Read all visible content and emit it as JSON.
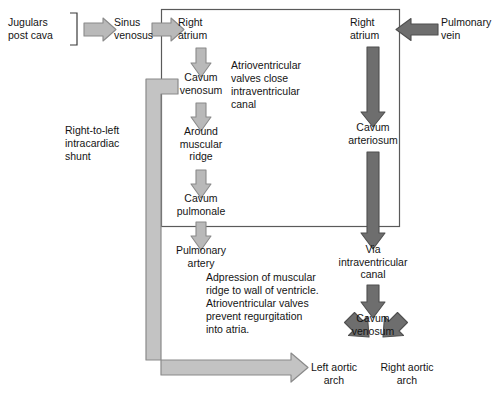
{
  "diagram": {
    "colors": {
      "light_arrow_fill": "#b9b9b9",
      "light_arrow_stroke": "#8a8a8a",
      "dark_arrow_fill": "#6e6e6e",
      "dark_arrow_stroke": "#4f4f4f",
      "shunt_fill": "#c3c3c3",
      "shunt_stroke": "#8a8a8a",
      "box_stroke": "#5a5a5a",
      "text": "#141414",
      "background": "#ffffff"
    },
    "nodes": {
      "jugulars": "Jugulars\npost cava",
      "sinus_venosus": "Sinus\nvenosus",
      "right_atrium_left": "Right\natrium",
      "cavum_venosum_left": "Cavum\nvenosum",
      "around_muscular_ridge": "Around\nmuscular\nridge",
      "cavum_pulmonale": "Cavum\npulmonale",
      "pulmonary_artery": "Pulmonary\nartery",
      "right_atrium_right": "Right\natrium",
      "pulmonary_vein": "Pulmonary\nvein",
      "cavum_arteriosum": "Cavum\narteriosum",
      "via_intraventricular_canal": "Via\nintraventricular\ncanal",
      "cavum_venosum_right": "Cavum\nvenosum",
      "left_aortic_arch": "Left aortic\narch",
      "right_aortic_arch": "Right aortic\narch"
    },
    "annotations": {
      "shunt": "Right-to-left\nintracardiac\nshunt",
      "av_valves_close": "Atrioventricular\nvalves close\nintraventricular\ncanal",
      "adpression": "Adpression of muscular\nridge to wall of ventricle.\nAtrioventricular valves\nprevent regurgitation\ninto atria."
    }
  }
}
